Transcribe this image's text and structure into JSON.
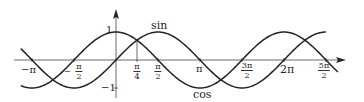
{
  "chart_data": {
    "type": "line",
    "title": "",
    "xlabel": "",
    "ylabel": "",
    "xlim": [
      -3.56,
      8.0
    ],
    "ylim": [
      -1,
      1
    ],
    "grid": false,
    "legend": "inline labels",
    "series": [
      {
        "name": "sin",
        "function": "sin(x)",
        "x_range": [
          -3.56,
          7.85
        ]
      },
      {
        "name": "cos",
        "function": "cos(x)",
        "x_range": [
          -3.56,
          8.3
        ]
      }
    ],
    "x_ticks": [
      {
        "label": "−π",
        "value": -3.1416
      },
      {
        "label": "−π/2",
        "value": -1.5708
      },
      {
        "label": "π/4",
        "value": 0.7854
      },
      {
        "label": "π/2",
        "value": 1.5708
      },
      {
        "label": "π",
        "value": 3.1416
      },
      {
        "label": "3π/2",
        "value": 4.7124
      },
      {
        "label": "2π",
        "value": 6.2832
      },
      {
        "label": "5π/2",
        "value": 7.854
      }
    ],
    "y_ticks": [
      {
        "label": "1",
        "value": 1
      },
      {
        "label": "−1",
        "value": -1
      }
    ],
    "annotations": [
      {
        "text": "vertical line at x = π/4 from axis to intersection of sin and cos",
        "x": 0.7854
      }
    ]
  },
  "labels": {
    "sin": "sin",
    "cos": "cos",
    "y_one": "1",
    "y_minus_one": "−1",
    "minus_pi": "−π",
    "minus_pi_over_2": {
      "num": "π",
      "den": "2",
      "sign": "−"
    },
    "pi_over_4": {
      "num": "π",
      "den": "4"
    },
    "pi_over_2": {
      "num": "π",
      "den": "2"
    },
    "pi": "π",
    "three_pi_over_2": {
      "num": "3π",
      "den": "2"
    },
    "two_pi": "2π",
    "five_pi_over_2": {
      "num": "5π",
      "den": "2"
    }
  }
}
